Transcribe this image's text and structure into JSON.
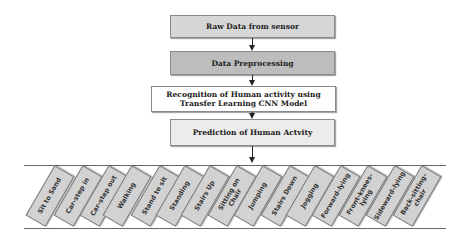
{
  "flowchart": {
    "steps": [
      {
        "label": "Raw Data from sensor",
        "fill": "#d6d6d6"
      },
      {
        "label": "Data Preprocessing",
        "fill": "#bdbdbd"
      },
      {
        "label": "Recognition of Human activity using Transfer Learning CNN Model",
        "fill": "#ffffff"
      },
      {
        "label": "Prediction of Human Actvity",
        "fill": "#ececec"
      }
    ]
  },
  "activities": [
    {
      "label": "Sit to Sand"
    },
    {
      "label": "Car-step in"
    },
    {
      "label": "Car-step out"
    },
    {
      "label": "Walking"
    },
    {
      "label": "Stand to sit"
    },
    {
      "label": "Standing"
    },
    {
      "label": "Stairs Up"
    },
    {
      "label": "Sitting on Chair"
    },
    {
      "label": "Jumping"
    },
    {
      "label": "Stairs Down"
    },
    {
      "label": "Jogging"
    },
    {
      "label": "Forward-lying"
    },
    {
      "label": "Front-knees-lying"
    },
    {
      "label": "Sideward-lying"
    },
    {
      "label": "Back-sitting-chair"
    }
  ]
}
